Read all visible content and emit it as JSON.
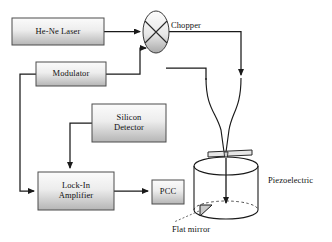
{
  "diagram": {
    "style": {
      "line_color": "#1a1a1a",
      "box_stroke": "#4d4d4d",
      "box_fill_light": "#f2f2f2",
      "box_fill_dark": "#b8b8b8",
      "background": "#ffffff"
    },
    "blocks": [
      {
        "id": "laser",
        "label": "He-Ne Laser",
        "x": 12,
        "y": 18,
        "w": 92,
        "h": 27
      },
      {
        "id": "modulator",
        "label": "Modulator",
        "x": 36,
        "y": 62,
        "w": 70,
        "h": 24
      },
      {
        "id": "detector",
        "label": "Silicon\nDetector",
        "x": 92,
        "y": 104,
        "w": 74,
        "h": 38
      },
      {
        "id": "lockin",
        "label": "Lock-In\nAmplifier",
        "x": 38,
        "y": 172,
        "w": 76,
        "h": 38
      },
      {
        "id": "pcc",
        "label": "PCC",
        "x": 152,
        "y": 180,
        "w": 32,
        "h": 24
      }
    ],
    "components": [
      {
        "id": "chopper",
        "label": "Chopper",
        "type": "rotating-disc"
      },
      {
        "id": "piezoelectric",
        "label": "Piezoelectric",
        "type": "cylinder"
      },
      {
        "id": "flat_mirror",
        "label": "Flat mirror",
        "type": "mirror"
      },
      {
        "id": "cantilever",
        "label": "",
        "type": "cantilever-tip"
      }
    ],
    "connections": [
      {
        "from": "laser",
        "to": "chopper",
        "kind": "arrow"
      },
      {
        "from": "modulator",
        "to": "chopper",
        "kind": "arrow"
      },
      {
        "from": "chopper",
        "to": "cantilever",
        "kind": "arrow"
      },
      {
        "from": "cantilever",
        "to": "detector",
        "kind": "arrow"
      },
      {
        "from": "detector",
        "to": "lockin",
        "kind": "arrow"
      },
      {
        "from": "modulator",
        "to": "lockin",
        "kind": "arrow"
      },
      {
        "from": "lockin",
        "to": "pcc",
        "kind": "arrow"
      }
    ]
  }
}
